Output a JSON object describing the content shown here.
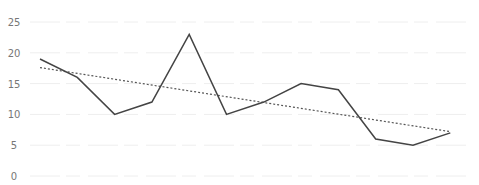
{
  "chart_data": {
    "type": "line",
    "title": "",
    "xlabel": "",
    "ylabel": "",
    "categories": [
      "1",
      "2",
      "3",
      "4",
      "5",
      "6",
      "7",
      "8",
      "9",
      "10",
      "11",
      "12"
    ],
    "series": [
      {
        "name": "Value",
        "values": [
          19,
          16,
          10,
          12,
          23,
          10,
          12,
          15,
          14,
          6,
          5,
          7
        ],
        "color": "#444444",
        "style": "solid"
      },
      {
        "name": "Linear trend",
        "values": [
          17.6,
          16.7,
          15.8,
          14.8,
          13.9,
          12.9,
          12.0,
          11.0,
          10.1,
          9.1,
          8.2,
          7.2
        ],
        "color": "#555555",
        "style": "dotted"
      }
    ],
    "yticks": [
      0,
      5,
      10,
      15,
      20,
      25
    ],
    "ylim": [
      0,
      25
    ],
    "grid": true,
    "legend": "none"
  },
  "axis": {
    "y_labels": [
      "0",
      "5",
      "10",
      "15",
      "20",
      "25"
    ]
  }
}
